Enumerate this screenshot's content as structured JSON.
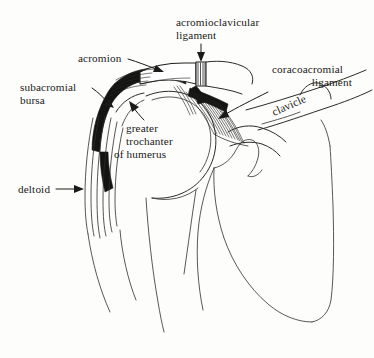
{
  "figure": {
    "background_color": "#fdfdfc",
    "ink_color": "#1a1a18",
    "label_font_size_px": 11.2
  },
  "labels": {
    "acromioclavicular_ligament": {
      "line1": "acromioclavicular",
      "line2": "ligament",
      "align": "left",
      "pointer": "down-arrow"
    },
    "acromion": {
      "line1": "acromion",
      "align": "left",
      "pointer": "right-down-arrow"
    },
    "coracoacromial_ligament": {
      "line1": "coracoacromial",
      "line2": "ligament",
      "align": "right",
      "pointer": "left-down-arrow"
    },
    "subacromial_bursa": {
      "line1": "subacromial",
      "line2": "bursa",
      "align": "left",
      "pointer": "right-down-arrow"
    },
    "greater_trochanter_of_humerus": {
      "line1": "greater",
      "line2": "trochanter",
      "line3": "of  humerus",
      "align": "left",
      "pointer": "up-left-arrow"
    },
    "clavicle": {
      "line1": "clavicle",
      "rotation_deg": 24,
      "pointer": "none"
    },
    "deltoid": {
      "line1": "deltoid",
      "align": "left",
      "pointer": "right-arrow"
    }
  },
  "structures": [
    {
      "name": "acromion",
      "style": "white-wedge"
    },
    {
      "name": "acromioclavicular-joint",
      "style": "vertical-hatch"
    },
    {
      "name": "subacromial-bursa",
      "style": "solid-dark-crescent"
    },
    {
      "name": "coracoacromial-ligament",
      "style": "fanned-hatch"
    },
    {
      "name": "clavicle",
      "style": "outline"
    },
    {
      "name": "humeral-head",
      "style": "outline"
    },
    {
      "name": "greater-trochanter",
      "style": "outline"
    },
    {
      "name": "deltoid",
      "style": "fiber-striations"
    },
    {
      "name": "scapula",
      "style": "outline"
    },
    {
      "name": "humerus-shaft",
      "style": "outline"
    }
  ]
}
